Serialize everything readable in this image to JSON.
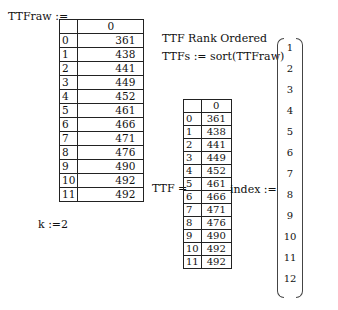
{
  "ttf_raw": {
    "label": "TTFraw :=",
    "column_header": "0",
    "rows": [
      {
        "i": "0",
        "v": "361"
      },
      {
        "i": "1",
        "v": "438"
      },
      {
        "i": "2",
        "v": "441"
      },
      {
        "i": "3",
        "v": "449"
      },
      {
        "i": "4",
        "v": "452"
      },
      {
        "i": "5",
        "v": "461"
      },
      {
        "i": "6",
        "v": "466"
      },
      {
        "i": "7",
        "v": "471"
      },
      {
        "i": "8",
        "v": "476"
      },
      {
        "i": "9",
        "v": "490"
      },
      {
        "i": "10",
        "v": "492"
      },
      {
        "i": "11",
        "v": "492"
      }
    ]
  },
  "heading": "TTF Rank Ordered",
  "sort_def": "TTFs := sort(TTFraw)",
  "k_def": "k :=2",
  "ttf_sorted": {
    "label": "TTF =",
    "column_header": "0",
    "rows": [
      {
        "i": "0",
        "v": "361"
      },
      {
        "i": "1",
        "v": "438"
      },
      {
        "i": "2",
        "v": "441"
      },
      {
        "i": "3",
        "v": "449"
      },
      {
        "i": "4",
        "v": "452"
      },
      {
        "i": "5",
        "v": "461"
      },
      {
        "i": "6",
        "v": "466"
      },
      {
        "i": "7",
        "v": "471"
      },
      {
        "i": "8",
        "v": "476"
      },
      {
        "i": "9",
        "v": "490"
      },
      {
        "i": "10",
        "v": "492"
      },
      {
        "i": "11",
        "v": "492"
      }
    ]
  },
  "index_vector": {
    "label": "index :=",
    "values": [
      "1",
      "2",
      "3",
      "4",
      "5",
      "6",
      "7",
      "8",
      "9",
      "10",
      "11",
      "12"
    ]
  }
}
